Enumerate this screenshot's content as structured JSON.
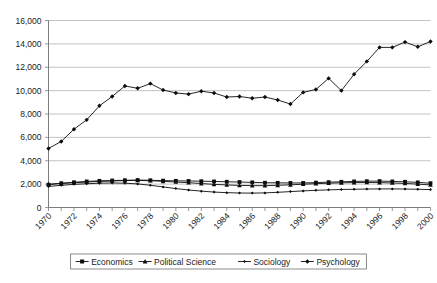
{
  "chart_data": {
    "type": "line",
    "title": "",
    "xlabel": "",
    "ylabel": "",
    "xlim": [
      1970,
      2000
    ],
    "ylim": [
      0,
      16000
    ],
    "ytick_labels": [
      "0",
      "2,000",
      "4,000",
      "6,000",
      "8,000",
      "10,000",
      "12,000",
      "14,000",
      "16,000"
    ],
    "ytick_values": [
      0,
      2000,
      4000,
      6000,
      8000,
      10000,
      12000,
      14000,
      16000
    ],
    "xtick_labels": [
      "1970",
      "1972",
      "1974",
      "1976",
      "1978",
      "1980",
      "1982",
      "1984",
      "1986",
      "1988",
      "1990",
      "1992",
      "1994",
      "1996",
      "1998",
      "2000"
    ],
    "xtick_values": [
      1970,
      1972,
      1974,
      1976,
      1978,
      1980,
      1982,
      1984,
      1986,
      1988,
      1990,
      1992,
      1994,
      1996,
      1998,
      2000
    ],
    "x": [
      1970,
      1971,
      1972,
      1973,
      1974,
      1975,
      1976,
      1977,
      1978,
      1979,
      1980,
      1981,
      1982,
      1983,
      1984,
      1985,
      1986,
      1987,
      1988,
      1989,
      1990,
      1991,
      1992,
      1993,
      1994,
      1995,
      1996,
      1997,
      1998,
      1999,
      2000
    ],
    "grid": true,
    "grid_axis": "y",
    "legend_position": "bottom",
    "series": [
      {
        "name": "Economics",
        "marker": "square",
        "values": [
          1950,
          2080,
          2160,
          2230,
          2280,
          2310,
          2330,
          2350,
          2330,
          2300,
          2280,
          2270,
          2250,
          2230,
          2200,
          2180,
          2150,
          2120,
          2110,
          2100,
          2100,
          2130,
          2170,
          2200,
          2230,
          2250,
          2260,
          2230,
          2200,
          2150,
          2080
        ]
      },
      {
        "name": "Political Science",
        "marker": "triangle",
        "values": [
          2000,
          2050,
          2120,
          2180,
          2230,
          2270,
          2300,
          2320,
          2290,
          2240,
          2180,
          2120,
          2050,
          1980,
          1930,
          1890,
          1870,
          1870,
          1900,
          1940,
          1990,
          2040,
          2080,
          2110,
          2130,
          2140,
          2130,
          2100,
          2060,
          2000,
          1930
        ]
      },
      {
        "name": "Sociology",
        "marker": "cross",
        "values": [
          1800,
          1900,
          1980,
          2030,
          2080,
          2100,
          2080,
          2020,
          1900,
          1760,
          1620,
          1500,
          1400,
          1320,
          1270,
          1240,
          1230,
          1250,
          1300,
          1360,
          1420,
          1470,
          1510,
          1540,
          1560,
          1580,
          1590,
          1590,
          1580,
          1560,
          1530
        ]
      },
      {
        "name": "Psychology",
        "marker": "diamond",
        "values": [
          5050,
          5650,
          6700,
          7500,
          8700,
          9500,
          10400,
          10200,
          10600,
          10050,
          9800,
          9700,
          9950,
          9800,
          9450,
          9500,
          9350,
          9450,
          9200,
          8850,
          9850,
          10100,
          11050,
          10000,
          11400,
          12500,
          13700,
          13700,
          14150,
          13750,
          14200
        ]
      }
    ]
  },
  "legend": {
    "entries": [
      {
        "label": "Economics"
      },
      {
        "label": "Political Science"
      },
      {
        "label": "Sociology"
      },
      {
        "label": "Psychology"
      }
    ]
  }
}
